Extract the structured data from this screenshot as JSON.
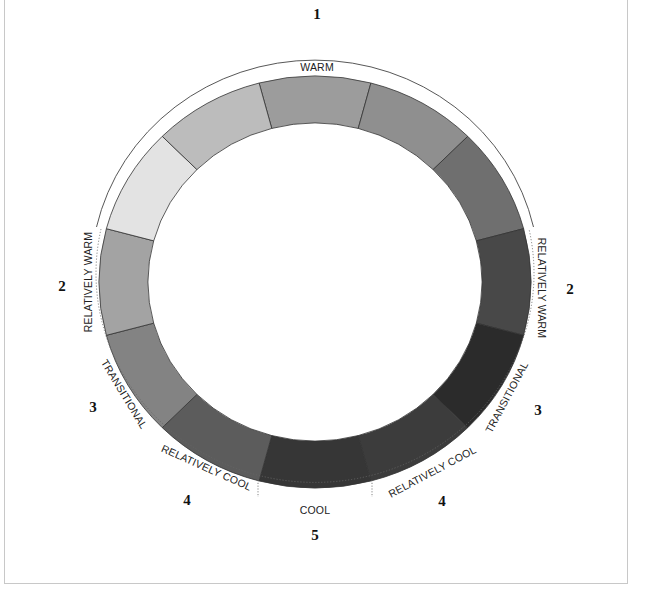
{
  "diagram": {
    "type": "color-temperature-wheel",
    "center": {
      "x": 315,
      "y": 282
    },
    "ring": {
      "outer_rx": 216,
      "outer_ry": 206,
      "inner_rx": 167,
      "inner_ry": 159
    },
    "segments": [
      {
        "center_angle": 90,
        "color": "#9c9c9c"
      },
      {
        "center_angle": 60,
        "color": "#8f8f8f"
      },
      {
        "center_angle": 30,
        "color": "#6f6f6f"
      },
      {
        "center_angle": 0,
        "color": "#484848"
      },
      {
        "center_angle": -30,
        "color": "#2b2b2b"
      },
      {
        "center_angle": -60,
        "color": "#3c3c3c"
      },
      {
        "center_angle": -90,
        "color": "#363636"
      },
      {
        "center_angle": -120,
        "color": "#5c5c5c"
      },
      {
        "center_angle": -150,
        "color": "#838383"
      },
      {
        "center_angle": 180,
        "color": "#a3a3a3"
      },
      {
        "center_angle": 150,
        "color": "#e3e3e3"
      },
      {
        "center_angle": 120,
        "color": "#bcbcbc"
      }
    ],
    "zones": [
      {
        "id": "warm",
        "number": "1",
        "label": "WARM",
        "arc": "solid"
      },
      {
        "id": "relatively-warm-left",
        "number": "2",
        "label": "RELATIVELY WARM",
        "arc": "dotted"
      },
      {
        "id": "relatively-warm-right",
        "number": "2",
        "label": "RELATIVELY WARM",
        "arc": "dotted"
      },
      {
        "id": "transitional-left",
        "number": "3",
        "label": "TRANSITIONAL",
        "arc": "dotted"
      },
      {
        "id": "transitional-right",
        "number": "3",
        "label": "TRANSITIONAL",
        "arc": "dotted"
      },
      {
        "id": "relatively-cool-left",
        "number": "4",
        "label": "RELATIVELY COOL",
        "arc": "dotted"
      },
      {
        "id": "relatively-cool-right",
        "number": "4",
        "label": "RELATIVELY COOL",
        "arc": "dotted"
      },
      {
        "id": "cool",
        "number": "5",
        "label": "COOL",
        "arc": "dotted"
      }
    ]
  }
}
